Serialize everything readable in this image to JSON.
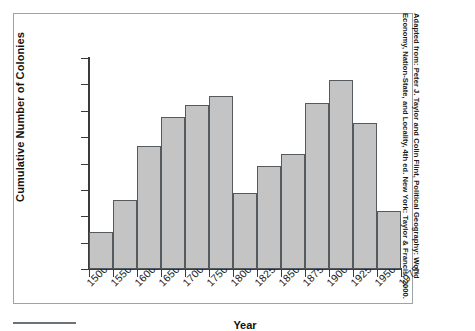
{
  "chart_data": {
    "type": "bar",
    "title": "",
    "xlabel": "Year",
    "ylabel": "Cumulative Number of Colonies",
    "categories": [
      "1500",
      "1550",
      "1600",
      "1650",
      "1700",
      "1750",
      "1800",
      "1825",
      "1850",
      "1875",
      "1900",
      "1925",
      "1950"
    ],
    "bin_starts": [
      1500,
      1550,
      1600,
      1650,
      1700,
      1750,
      1800,
      1825,
      1850,
      1875,
      1900,
      1925,
      1950
    ],
    "bin_ends": [
      1550,
      1600,
      1650,
      1700,
      1750,
      1800,
      1825,
      1850,
      1875,
      1900,
      1925,
      1950,
      1975
    ],
    "values": [
      28,
      52,
      93,
      115,
      124,
      131,
      58,
      78,
      87,
      126,
      143,
      111,
      44
    ],
    "ylim": [
      0,
      160
    ],
    "ytick_labels": [
      "0",
      "20",
      "40",
      "60",
      "80",
      "100",
      "120",
      "140",
      "160"
    ],
    "ytick_values": [
      0,
      20,
      40,
      60,
      80,
      100,
      120,
      140,
      160
    ],
    "xtick_labels": [
      "1500",
      "1550",
      "1600",
      "1650",
      "1700",
      "1750",
      "1800",
      "1825",
      "1850",
      "1875",
      "1900",
      "1925",
      "1950",
      "1975"
    ],
    "xtick_values": [
      1500,
      1550,
      1600,
      1650,
      1700,
      1750,
      1800,
      1825,
      1850,
      1875,
      1900,
      1925,
      1950,
      1975
    ],
    "grid": false,
    "legend": null,
    "bar_fill_color": "#c4c4c4",
    "bar_edge_color": "#555a5e",
    "axis_color": "#3a3a3a"
  },
  "source_note": "Adapted from: Peter J. Taylor and Colin Flint, Political Geography: World Economy, Nation-State, and Locality, 4th ed. New York: Taylor & Francis, 2000."
}
